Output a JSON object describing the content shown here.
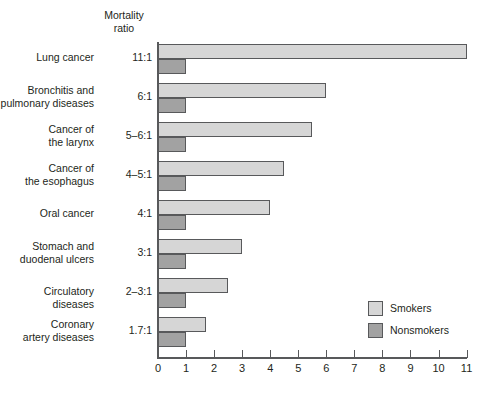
{
  "chart_data": {
    "type": "bar",
    "title": "",
    "subtitle": "",
    "orientation": "horizontal",
    "header_label_line1": "Mortality",
    "header_label_line2": "ratio",
    "xlabel": "",
    "ylabel": "",
    "xlim": [
      0,
      11
    ],
    "grid": false,
    "legend_position": "inside-right-lower",
    "xticks": [
      0,
      1,
      2,
      3,
      4,
      5,
      6,
      7,
      8,
      9,
      10,
      11
    ],
    "xtick_labels": [
      "0",
      "1",
      "2",
      "3",
      "4",
      "5",
      "6",
      "7",
      "8",
      "9",
      "10",
      "11"
    ],
    "categories": [
      "Lung cancer",
      "Bronchitis and pulmonary diseases",
      "Cancer of the larynx",
      "Cancer of the esophagus",
      "Oral cancer",
      "Stomach and duodenal ulcers",
      "Circulatory diseases",
      "Coronary artery diseases"
    ],
    "ratio_labels": [
      "11:1",
      "6:1",
      "5–6:1",
      "4–5:1",
      "4:1",
      "3:1",
      "2–3:1",
      "1.7:1"
    ],
    "series": [
      {
        "name": "Smokers",
        "color": "#d6d6d6",
        "values": [
          11.0,
          6.0,
          5.5,
          4.5,
          4.0,
          3.0,
          2.5,
          1.7
        ]
      },
      {
        "name": "Nonsmokers",
        "color": "#a2a2a2",
        "values": [
          1.0,
          1.0,
          1.0,
          1.0,
          1.0,
          1.0,
          1.0,
          1.0
        ]
      }
    ],
    "legend": [
      {
        "label": "Smokers",
        "color": "#d6d6d6"
      },
      {
        "label": "Nonsmokers",
        "color": "#a2a2a2"
      }
    ]
  },
  "rows": [
    {
      "name_line1": "Lung cancer",
      "name_line2": "",
      "ratio": "11:1",
      "smokers": 11.0,
      "nonsmokers": 1.0
    },
    {
      "name_line1": "Bronchitis and",
      "name_line2": "pulmonary diseases",
      "ratio": "6:1",
      "smokers": 6.0,
      "nonsmokers": 1.0
    },
    {
      "name_line1": "Cancer of",
      "name_line2": "the larynx",
      "ratio": "5–6:1",
      "smokers": 5.5,
      "nonsmokers": 1.0
    },
    {
      "name_line1": "Cancer of",
      "name_line2": "the esophagus",
      "ratio": "4–5:1",
      "smokers": 4.5,
      "nonsmokers": 1.0
    },
    {
      "name_line1": "Oral cancer",
      "name_line2": "",
      "ratio": "4:1",
      "smokers": 4.0,
      "nonsmokers": 1.0
    },
    {
      "name_line1": "Stomach and",
      "name_line2": "duodenal ulcers",
      "ratio": "3:1",
      "smokers": 3.0,
      "nonsmokers": 1.0
    },
    {
      "name_line1": "Circulatory diseases",
      "name_line2": "",
      "ratio": "2–3:1",
      "smokers": 2.5,
      "nonsmokers": 1.0
    },
    {
      "name_line1": "Coronary",
      "name_line2": "artery diseases",
      "ratio": "1.7:1",
      "smokers": 1.7,
      "nonsmokers": 1.0
    }
  ],
  "colors": {
    "smokers": "#d6d6d6",
    "nonsmokers": "#a2a2a2",
    "axis": "#58595b",
    "text": "#231f20",
    "background": "#ffffff"
  }
}
